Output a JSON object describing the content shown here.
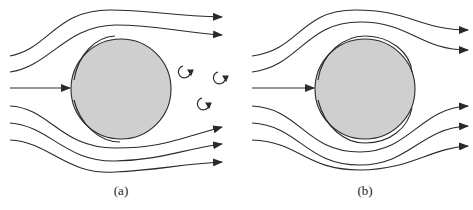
{
  "figure": {
    "panels": [
      {
        "id": "a",
        "label": "(a)",
        "description": "Flow past cylinder with wake vortices"
      },
      {
        "id": "b",
        "label": "(b)",
        "description": "Flow past cylinder without wake (ideal flow)"
      }
    ],
    "colors": {
      "cylinder_fill": "#cfcfcf",
      "stroke": "#2a2a2a",
      "background": "#ffffff"
    }
  }
}
